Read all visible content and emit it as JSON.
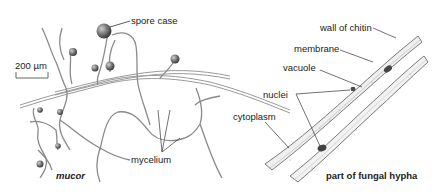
{
  "diagram": {
    "left_panel": {
      "title": "mucor",
      "scale_bar": "200 µm",
      "labels": {
        "spore_case": "spore case",
        "mycelium": "mycelium"
      }
    },
    "right_panel": {
      "title": "part of fungal hypha",
      "labels": {
        "wall": "wall of chitin",
        "membrane": "membrane",
        "vacuole": "vacuole",
        "nuclei": "nuclei",
        "cytoplasm": "cytoplasm"
      }
    },
    "colors": {
      "hypha_stroke": "#8a8a8a",
      "spore": "#6e6e6e",
      "hypha_fill": "#eeeeee",
      "nucleus": "#4a4a4a",
      "leader": "#333333"
    }
  }
}
